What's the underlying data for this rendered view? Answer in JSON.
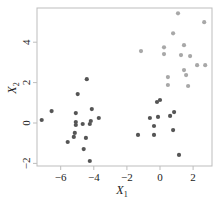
{
  "chart_data": {
    "type": "scatter",
    "title": "",
    "xlabel": "X1",
    "ylabel": "X2",
    "xlim": [
      -7.4,
      3.1
    ],
    "ylim": [
      -2.1,
      5.7
    ],
    "xticks": [
      -6,
      -4,
      -2,
      0,
      2
    ],
    "yticks": [
      -2,
      0,
      2,
      4
    ],
    "xtick_labels": [
      "−6",
      "−4",
      "−2",
      "0",
      "2"
    ],
    "ytick_labels": [
      "−2",
      "0",
      "2",
      "4"
    ],
    "grid": false,
    "legend": null,
    "series": [
      {
        "name": "cluster-gray",
        "color": "#a8a8a8",
        "points": [
          [
            1.09,
            5.43
          ],
          [
            2.67,
            4.99
          ],
          [
            0.79,
            4.44
          ],
          [
            1.45,
            3.85
          ],
          [
            0.24,
            3.75
          ],
          [
            -1.15,
            3.56
          ],
          [
            0.24,
            3.41
          ],
          [
            1.27,
            3.36
          ],
          [
            1.82,
            3.31
          ],
          [
            2.24,
            2.86
          ],
          [
            2.73,
            2.86
          ],
          [
            1.45,
            2.62
          ],
          [
            1.58,
            2.37
          ],
          [
            0.48,
            2.27
          ],
          [
            0.48,
            1.88
          ],
          [
            1.7,
            1.83
          ]
        ]
      },
      {
        "name": "cluster-dark",
        "color": "#555555",
        "points": [
          [
            -0.18,
            1.04
          ],
          [
            0.0,
            1.14
          ],
          [
            -0.61,
            0.25
          ],
          [
            -0.12,
            0.3
          ],
          [
            0.61,
            0.35
          ],
          [
            0.85,
            0.54
          ],
          [
            -0.36,
            -0.15
          ],
          [
            0.79,
            -0.35
          ],
          [
            -1.33,
            -0.59
          ],
          [
            -0.36,
            -0.59
          ],
          [
            1.15,
            -1.58
          ],
          [
            -4.42,
            2.17
          ],
          [
            -4.97,
            1.43
          ],
          [
            -6.55,
            0.59
          ],
          [
            -7.15,
            0.15
          ],
          [
            -5.09,
            0.49
          ],
          [
            -4.12,
            0.69
          ],
          [
            -3.7,
            0.25
          ],
          [
            -4.18,
            0.1
          ],
          [
            -4.24,
            -0.05
          ],
          [
            -5.09,
            0.05
          ],
          [
            -5.09,
            -0.1
          ],
          [
            -4.67,
            -0.05
          ],
          [
            -5.15,
            -0.49
          ],
          [
            -5.21,
            -0.69
          ],
          [
            -5.58,
            -0.94
          ],
          [
            -4.48,
            -0.74
          ],
          [
            -4.61,
            -1.29
          ],
          [
            -4.24,
            -1.88
          ]
        ]
      }
    ]
  },
  "axes": {
    "x_title_main": "X",
    "x_title_sub": "1",
    "y_title_main": "X",
    "y_title_sub": "2"
  },
  "style": {
    "frame_color": "#bdbdbd",
    "tick_color": "#bdbdbd"
  }
}
